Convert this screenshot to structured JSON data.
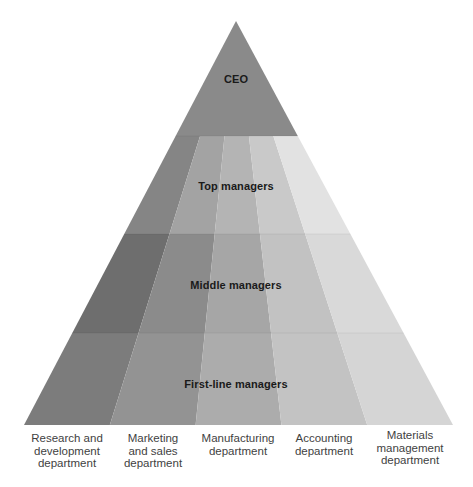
{
  "diagram": {
    "type": "organizational-pyramid",
    "geometry": {
      "apex": [
        236,
        21
      ],
      "base_left": [
        24,
        425
      ],
      "base_right": [
        453,
        425
      ],
      "tier_bottoms": [
        136,
        234,
        333,
        425
      ]
    },
    "tiers": [
      {
        "id": "ceo",
        "label": "CEO",
        "color": "#8a8a8a",
        "label_y": 79
      },
      {
        "id": "top",
        "label": "Top managers",
        "label_y": 186,
        "stripe_colors": [
          "#858585",
          "#a3a3a3",
          "#b4b4b4",
          "#c9c9c9",
          "#e2e2e2"
        ]
      },
      {
        "id": "middle",
        "label": "Middle managers",
        "label_y": 285,
        "stripe_colors": [
          "#6e6e6e",
          "#8b8b8b",
          "#a6a6a6",
          "#c2c2c2",
          "#d9d9d9"
        ]
      },
      {
        "id": "first-line",
        "label": "First-line managers",
        "label_y": 384,
        "stripe_colors": [
          "#7c7c7c",
          "#939393",
          "#acacac",
          "#c3c3c3",
          "#d5d5d5"
        ]
      }
    ],
    "departments": [
      {
        "id": "rnd",
        "lines": [
          "Research and",
          "development",
          "department"
        ],
        "x": 67,
        "y": 432
      },
      {
        "id": "marketing",
        "lines": [
          "Marketing",
          "and sales",
          "department"
        ],
        "x": 153,
        "y": 432
      },
      {
        "id": "manufacturing",
        "lines": [
          "Manufacturing",
          "department"
        ],
        "x": 238,
        "y": 432
      },
      {
        "id": "accounting",
        "lines": [
          "Accounting",
          "department"
        ],
        "x": 324,
        "y": 432
      },
      {
        "id": "materials",
        "lines": [
          "Materials",
          "management",
          "department"
        ],
        "x": 410,
        "y": 429
      }
    ]
  }
}
